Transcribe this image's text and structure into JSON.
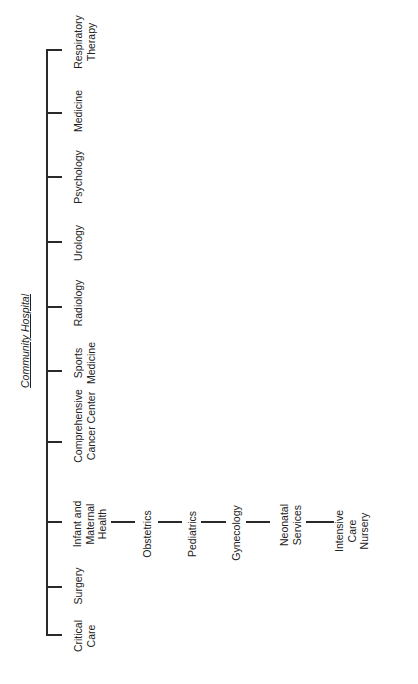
{
  "title": "Community Hospital",
  "departments": [
    {
      "name": "Respiratory Therapy",
      "lines": [
        "Respiratory",
        "Therapy"
      ]
    },
    {
      "name": "Medicine",
      "lines": [
        "Medicine"
      ]
    },
    {
      "name": "Psychology",
      "lines": [
        "Psychology"
      ]
    },
    {
      "name": "Urology",
      "lines": [
        "Urology"
      ]
    },
    {
      "name": "Radiology",
      "lines": [
        "Radiology"
      ]
    },
    {
      "name": "Sports Medicine",
      "lines": [
        "Sports",
        "Medicine"
      ]
    },
    {
      "name": "Comprehensive Cancer Center",
      "lines": [
        "Comprehensive",
        "Cancer Center"
      ]
    },
    {
      "name": "Infant and Maternal Health",
      "lines": [
        "Infant and",
        "Maternal",
        "Health"
      ]
    },
    {
      "name": "Surgery",
      "lines": [
        "Surgery"
      ]
    },
    {
      "name": "Critical Care",
      "lines": [
        "Critical",
        "Care"
      ]
    }
  ],
  "infant_maternal_subunits": [
    {
      "name": "Obstetrics",
      "lines": [
        "Obstetrics"
      ]
    },
    {
      "name": "Pediatrics",
      "lines": [
        "Pediatrics"
      ]
    },
    {
      "name": "Gynecology",
      "lines": [
        "Gynecology"
      ]
    },
    {
      "name": "Neonatal Services",
      "lines": [
        "Neonatal",
        "Services"
      ]
    },
    {
      "name": "Intensive Care Nursery",
      "lines": [
        "Intensive",
        "Care",
        "Nursery"
      ]
    }
  ]
}
